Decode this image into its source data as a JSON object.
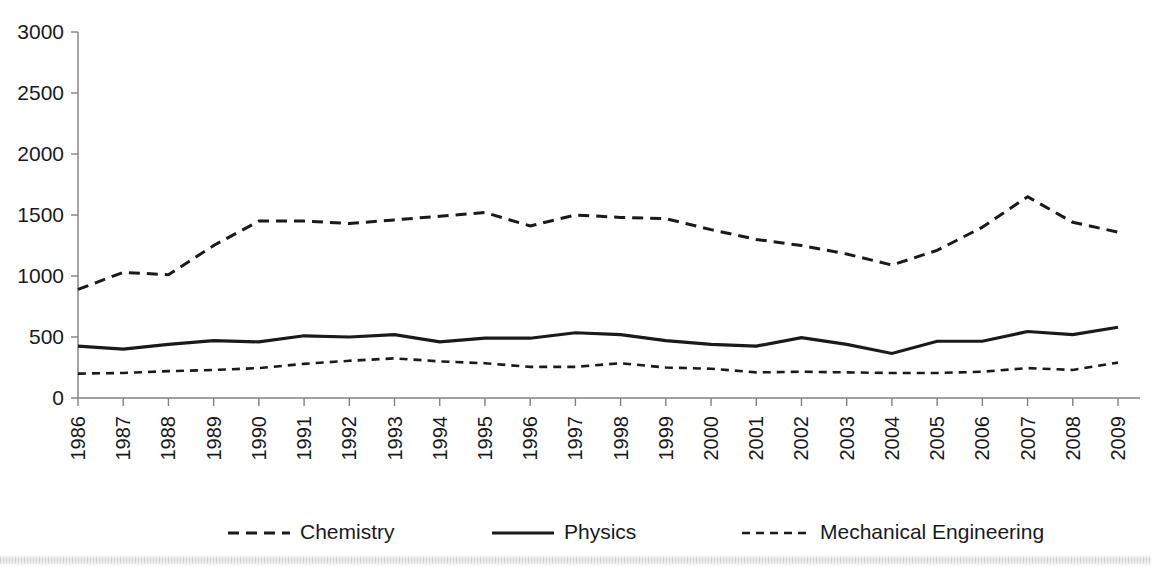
{
  "chart_data": {
    "type": "line",
    "title": "",
    "xlabel": "",
    "ylabel": "",
    "ylim": [
      0,
      3000
    ],
    "ytick_values": [
      0,
      500,
      1000,
      1500,
      2000,
      2500,
      3000
    ],
    "ytick_labels": [
      "0",
      "500",
      "1000",
      "1500",
      "2000",
      "2500",
      "3000"
    ],
    "grid": false,
    "legend_position": "bottom",
    "categories": [
      1986,
      1987,
      1988,
      1989,
      1990,
      1991,
      1992,
      1993,
      1994,
      1995,
      1996,
      1997,
      1998,
      1999,
      2000,
      2001,
      2002,
      2003,
      2004,
      2005,
      2006,
      2007,
      2008,
      2009
    ],
    "xtick_labels": [
      "1986",
      "1987",
      "1988",
      "1989",
      "1990",
      "1991",
      "1992",
      "1993",
      "1994",
      "1995",
      "1996",
      "1997",
      "1998",
      "1999",
      "2000",
      "2001",
      "2002",
      "2003",
      "2004",
      "2005",
      "2006",
      "2007",
      "2008",
      "2009"
    ],
    "series": [
      {
        "name": "Chemistry",
        "style": "dashed",
        "color": "#1a1a1a",
        "values": [
          890,
          1030,
          1010,
          1250,
          1450,
          1450,
          1430,
          1460,
          1490,
          1520,
          1410,
          1500,
          1480,
          1470,
          1380,
          1300,
          1250,
          1180,
          1090,
          1210,
          1400,
          1650,
          1440,
          1360
        ]
      },
      {
        "name": "Physics",
        "style": "solid",
        "color": "#1a1a1a",
        "values": [
          425,
          400,
          440,
          470,
          460,
          510,
          500,
          520,
          460,
          490,
          490,
          535,
          520,
          470,
          440,
          425,
          495,
          440,
          365,
          465,
          465,
          545,
          520,
          580
        ]
      },
      {
        "name": "Mechanical Engineering",
        "style": "dotted",
        "color": "#1a1a1a",
        "values": [
          200,
          205,
          220,
          230,
          245,
          280,
          305,
          325,
          300,
          285,
          255,
          255,
          285,
          250,
          240,
          210,
          215,
          210,
          205,
          205,
          215,
          245,
          230,
          290
        ]
      }
    ]
  },
  "legend": {
    "items": [
      {
        "label": "Chemistry",
        "style": "dashed"
      },
      {
        "label": "Physics",
        "style": "solid"
      },
      {
        "label": "Mechanical Engineering",
        "style": "dotted"
      }
    ]
  }
}
